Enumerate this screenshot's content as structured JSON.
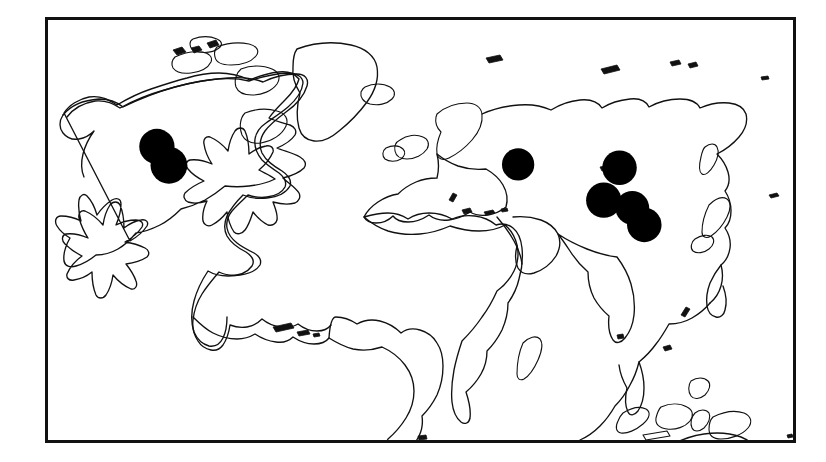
{
  "figure": {
    "type": "distribution-map",
    "projection": "world-outline",
    "background_color": "#ffffff",
    "frame": {
      "visible": true,
      "color": "#111111",
      "stroke_width": 3,
      "x": 45,
      "y": 17,
      "width": 751,
      "height": 426
    },
    "coastline_color": "#111111",
    "marker_color": "#000000",
    "marker_shape": "filled-circle",
    "marker_count": 7,
    "landmasses": [
      "North America",
      "South America",
      "Greenland",
      "Iceland",
      "Europe",
      "Africa",
      "Asia",
      "Madagascar",
      "Indonesia",
      "Philippines",
      "Japan",
      "Australia",
      "New Zealand",
      "British Isles",
      "Caribbean islands",
      "Canadian Arctic Archipelago"
    ]
  },
  "chart_data": {
    "type": "scatter",
    "title": "",
    "xlabel": "",
    "ylabel": "",
    "xlim": [
      -180,
      180
    ],
    "ylim": [
      -90,
      90
    ],
    "grid": false,
    "legend": "none",
    "markers": [
      {
        "id": "marker-na-north",
        "region": "western North America (northern)",
        "cx_pct": 14.9,
        "cy_pct": 30.4,
        "r_pct": 2.35
      },
      {
        "id": "marker-na-south",
        "region": "western North America (southern)",
        "cx_pct": 16.5,
        "cy_pct": 34.8,
        "r_pct": 2.45
      },
      {
        "id": "marker-caspian",
        "region": "Caspian Sea / Central Asia",
        "cx_pct": 63.0,
        "cy_pct": 34.6,
        "r_pct": 2.15
      },
      {
        "id": "marker-mongolia",
        "region": "Mongolia / northern China",
        "cx_pct": 76.5,
        "cy_pct": 35.4,
        "r_pct": 2.3
      },
      {
        "id": "marker-himalaya",
        "region": "Himalaya / western China",
        "cx_pct": 74.4,
        "cy_pct": 43.0,
        "r_pct": 2.35
      },
      {
        "id": "marker-central-china",
        "region": "central-eastern China",
        "cx_pct": 78.2,
        "cy_pct": 44.8,
        "r_pct": 2.25
      },
      {
        "id": "marker-southeast-china",
        "region": "southeastern China",
        "cx_pct": 79.8,
        "cy_pct": 48.8,
        "r_pct": 2.3
      }
    ]
  }
}
